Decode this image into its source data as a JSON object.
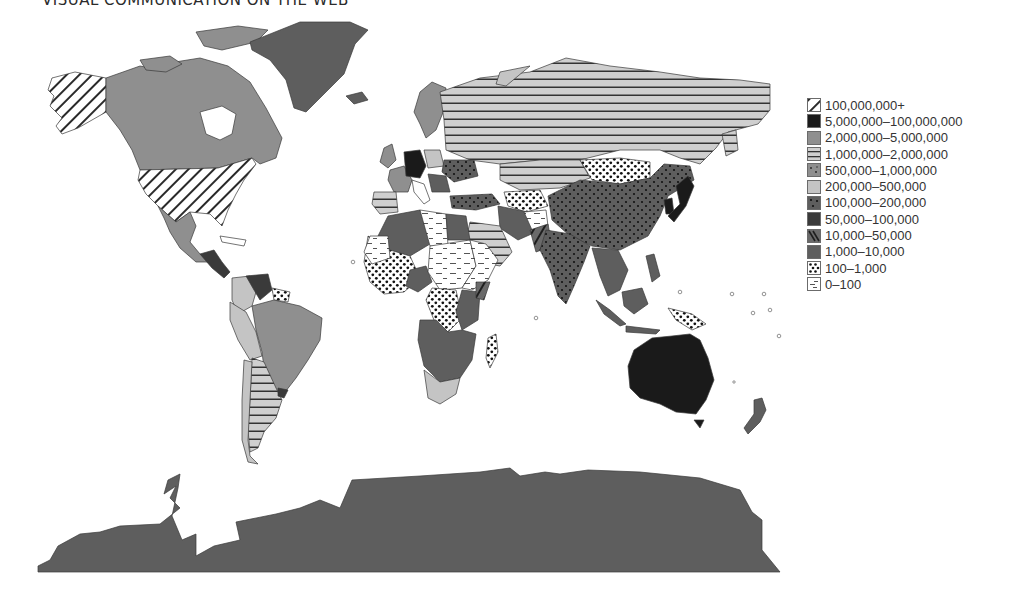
{
  "header": {
    "title": "VISUAL COMMUNICATION ON THE WEB"
  },
  "legend": {
    "items": [
      {
        "label": "100,000,000+",
        "pattern": "diagonal-hatch"
      },
      {
        "label": "5,000,000–100,000,000",
        "pattern": "black"
      },
      {
        "label": "2,000,000–5,000,000",
        "pattern": "medium-grey"
      },
      {
        "label": "1,000,000–2,000,000",
        "pattern": "horizontal-stripes"
      },
      {
        "label": "500,000–1,000,000",
        "pattern": "grey-sparse-dots"
      },
      {
        "label": "200,000–500,000",
        "pattern": "light-grey"
      },
      {
        "label": "100,000–200,000",
        "pattern": "dark-grey-dots"
      },
      {
        "label": "50,000–100,000",
        "pattern": "very-dark-grey"
      },
      {
        "label": "10,000–50,000",
        "pattern": "dark-diagonal-hatch"
      },
      {
        "label": "1,000–10,000",
        "pattern": "dark-grey"
      },
      {
        "label": "100–1,000",
        "pattern": "white-bold-dots"
      },
      {
        "label": "0–100",
        "pattern": "white-dashes"
      }
    ]
  },
  "colors": {
    "black": "#1a1a1a",
    "medium_grey": "#8f8f8f",
    "light_grey": "#c4c4c4",
    "dark_grey": "#5e5e5e",
    "very_dark_grey": "#3a3a3a",
    "stripe_bg": "#cfcfcf",
    "outline": "#444444"
  }
}
